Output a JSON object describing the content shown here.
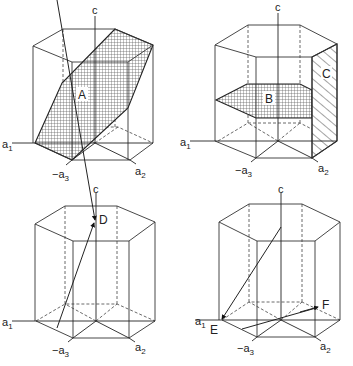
{
  "figure": {
    "panels": [
      {
        "id": "top-left",
        "axes": {
          "c": "c",
          "a1": "a",
          "a1_sub": "1",
          "a2": "a",
          "a2_sub": "2",
          "a3": "−a",
          "a3_sub": "3"
        },
        "features": [
          {
            "label": "A",
            "type": "plane",
            "fill": "cross-hatch"
          }
        ]
      },
      {
        "id": "top-right",
        "axes": {
          "c": "c",
          "a1": "a",
          "a1_sub": "1",
          "a2": "a",
          "a2_sub": "2",
          "a3": "−a",
          "a3_sub": "3"
        },
        "features": [
          {
            "label": "B",
            "type": "plane",
            "fill": "cross-hatch"
          },
          {
            "label": "C",
            "type": "plane",
            "fill": "diagonal-hatch"
          }
        ]
      },
      {
        "id": "bottom-left",
        "axes": {
          "c": "c",
          "a1": "a",
          "a1_sub": "1",
          "a2": "a",
          "a2_sub": "2",
          "a3": "−a",
          "a3_sub": "3"
        },
        "features": [
          {
            "label": "D",
            "type": "direction"
          }
        ]
      },
      {
        "id": "bottom-right",
        "axes": {
          "c": "c",
          "a1": "a",
          "a1_sub": "1",
          "a2": "a",
          "a2_sub": "2",
          "a3": "−a",
          "a3_sub": "3"
        },
        "features": [
          {
            "label": "E",
            "type": "direction"
          },
          {
            "label": "F",
            "type": "direction"
          }
        ]
      }
    ]
  }
}
